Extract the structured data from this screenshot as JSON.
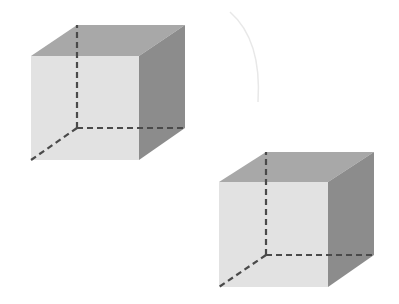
{
  "diagram": {
    "title": "",
    "colors": {
      "background": "#ffffff",
      "front_face": "#e2e2e2",
      "top_face": "#a8a8a8",
      "right_face": "#8c8c8c",
      "hidden_edges": "#4a4a4a",
      "arc": "#e6e6e6"
    },
    "cubes": [
      {
        "name": "cube-1",
        "front": [
          [
            31,
            56
          ],
          [
            139,
            56
          ],
          [
            139,
            160
          ],
          [
            31,
            160
          ]
        ],
        "top": [
          [
            31,
            56
          ],
          [
            77,
            25
          ],
          [
            185,
            25
          ],
          [
            139,
            56
          ]
        ],
        "right": [
          [
            139,
            56
          ],
          [
            185,
            25
          ],
          [
            185,
            128
          ],
          [
            139,
            160
          ]
        ],
        "hidden_vertex": [
          77,
          128
        ],
        "hidden_ends": [
          [
            77,
            25
          ],
          [
            185,
            128
          ],
          [
            31,
            160
          ]
        ]
      },
      {
        "name": "cube-2",
        "front": [
          [
            219,
            182
          ],
          [
            328,
            182
          ],
          [
            328,
            287
          ],
          [
            219,
            287
          ]
        ],
        "top": [
          [
            219,
            182
          ],
          [
            266,
            152
          ],
          [
            374,
            152
          ],
          [
            328,
            182
          ]
        ],
        "right": [
          [
            328,
            182
          ],
          [
            374,
            152
          ],
          [
            374,
            255
          ],
          [
            328,
            287
          ]
        ],
        "hidden_vertex": [
          266,
          255
        ],
        "hidden_ends": [
          [
            266,
            152
          ],
          [
            374,
            255
          ],
          [
            219,
            287
          ]
        ]
      }
    ]
  }
}
